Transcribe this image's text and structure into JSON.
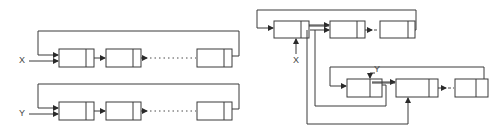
{
  "diagram": {
    "left": {
      "list_x": {
        "label": "X",
        "nodes": 3,
        "elision": "dotted",
        "circular": true
      },
      "list_y": {
        "label": "Y",
        "nodes": 3,
        "elision": "dotted",
        "circular": true
      }
    },
    "right": {
      "upper_list": {
        "pointer_label": "X",
        "nodes": 3,
        "elision": "dashed",
        "circular": true
      },
      "lower_list": {
        "pointer_label": "Y",
        "nodes": 3,
        "elision": "dashed",
        "circular": true
      },
      "description": "Circular lists X and Y joined by relinking pointers"
    },
    "colors": {
      "line": "#3a3a3a",
      "background": "#ffffff"
    }
  }
}
